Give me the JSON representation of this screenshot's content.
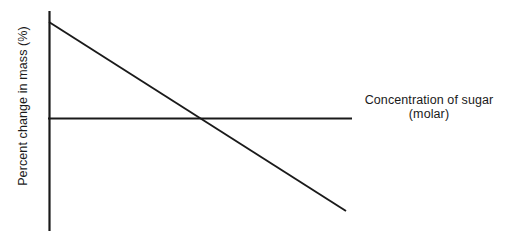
{
  "figure": {
    "background_color": "#ffffff",
    "line_color": "#1a1a1a",
    "text_color": "#1a1a1a",
    "width": 514,
    "height": 231
  },
  "axes": {
    "y_axis_label": "Percent change in mass (%)",
    "x_axis_label_line1": "Concentration of sugar",
    "x_axis_label_line2": "(molar)"
  },
  "chart_data": {
    "type": "line",
    "title": "",
    "xlabel": "Concentration of sugar (molar)",
    "ylabel": "Percent change in mass (%)",
    "grid": false,
    "legend": null,
    "xlim": [
      0,
      1
    ],
    "ylim": [
      -1,
      1
    ],
    "annotations": [],
    "reference_lines": [
      {
        "name": "zero-line",
        "orientation": "horizontal",
        "value": 0,
        "label": "",
        "x_start": 0,
        "x_end": 1.0
      }
    ],
    "series": [
      {
        "name": "percent change in mass",
        "x": [
          0,
          1.0
        ],
        "values": [
          0.9,
          -0.88
        ],
        "x_intercept": 0.61,
        "trend": "decreasing-linear"
      }
    ]
  },
  "geometry": {
    "y_axis": {
      "x": 49,
      "y_top": 11,
      "y_bottom": 231
    },
    "zero_line": {
      "y": 118,
      "x_start": 49,
      "x_end": 352
    },
    "data_line": {
      "x1": 49,
      "y1": 22,
      "x2": 346,
      "y2": 211
    }
  }
}
